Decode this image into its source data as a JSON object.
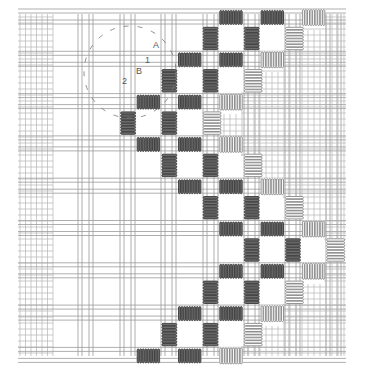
{
  "diagram": {
    "title": "",
    "type": "needlework stitch diagram",
    "colors": {
      "background": "#ffffff",
      "grid_line": "#9a9a9a",
      "grid_line_fine": "#b5b5b5",
      "stitch_dark": "#3a3a3a",
      "stitch_dark_fill": "#6e6e6e",
      "stitch_light": "#7a7a7a",
      "stitch_light_fill": "#ffffff",
      "annotation": "#555555"
    },
    "labels": [
      {
        "id": "label-A",
        "text": "A"
      },
      {
        "id": "label-1",
        "text": "1"
      },
      {
        "id": "label-B",
        "text": "B"
      },
      {
        "id": "label-2",
        "text": "2"
      }
    ],
    "callout": {
      "name": "detail-circle",
      "style": "dashed"
    },
    "stitch_legend": {
      "dark": "wrapped bar (worked)",
      "light": "wrapped bar (outlined)"
    },
    "stitch_rows": [
      {
        "orientation": "horizontal",
        "row": 0,
        "dark_cols": [
          5,
          6
        ],
        "light_cols": [
          7
        ]
      },
      {
        "orientation": "vertical",
        "row": 0,
        "dark_cols": [
          5,
          6
        ],
        "light_cols": [
          7
        ]
      },
      {
        "orientation": "horizontal",
        "row": 1,
        "dark_cols": [
          4,
          5
        ],
        "light_cols": [
          6
        ]
      },
      {
        "orientation": "vertical",
        "row": 1,
        "dark_cols": [
          4,
          5
        ],
        "light_cols": [
          6
        ]
      },
      {
        "orientation": "horizontal",
        "row": 2,
        "dark_cols": [
          3,
          4
        ],
        "light_cols": [
          5
        ]
      },
      {
        "orientation": "vertical",
        "row": 2,
        "dark_cols": [
          3,
          4
        ],
        "light_cols": [
          5
        ]
      },
      {
        "orientation": "horizontal",
        "row": 3,
        "dark_cols": [
          3,
          4
        ],
        "light_cols": [
          5
        ]
      },
      {
        "orientation": "vertical",
        "row": 3,
        "dark_cols": [
          4,
          5
        ],
        "light_cols": [
          6
        ]
      },
      {
        "orientation": "horizontal",
        "row": 4,
        "dark_cols": [
          4,
          5
        ],
        "light_cols": [
          6
        ]
      },
      {
        "orientation": "vertical",
        "row": 4,
        "dark_cols": [
          5,
          6
        ],
        "light_cols": [
          7
        ]
      },
      {
        "orientation": "horizontal",
        "row": 5,
        "dark_cols": [
          5,
          6
        ],
        "light_cols": [
          7
        ]
      },
      {
        "orientation": "vertical",
        "row": 5,
        "dark_cols": [
          6,
          7
        ],
        "light_cols": [
          8
        ]
      },
      {
        "orientation": "horizontal",
        "row": 6,
        "dark_cols": [
          5,
          6
        ],
        "light_cols": [
          7
        ]
      },
      {
        "orientation": "vertical",
        "row": 6,
        "dark_cols": [
          5,
          6
        ],
        "light_cols": [
          7
        ]
      },
      {
        "orientation": "horizontal",
        "row": 7,
        "dark_cols": [
          4,
          5
        ],
        "light_cols": [
          6
        ]
      },
      {
        "orientation": "vertical",
        "row": 7,
        "dark_cols": [
          4,
          5
        ],
        "light_cols": [
          6
        ]
      },
      {
        "orientation": "horizontal",
        "row": 8,
        "dark_cols": [
          3,
          4
        ],
        "light_cols": [
          5
        ]
      }
    ]
  }
}
